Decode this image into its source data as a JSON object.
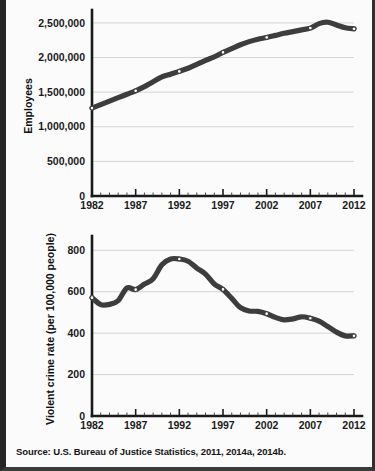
{
  "figure": {
    "background_color": "#fbfbfb",
    "frame_color": "#2b2b2b",
    "source_note": "Source: U.S. Bureau of Justice Statistics, 2011, 2014a, 2014b."
  },
  "chart_data": [
    {
      "type": "line",
      "id": "employees",
      "title": "",
      "xlabel": "",
      "ylabel": "Employees",
      "xlim": [
        1982,
        2012
      ],
      "ylim": [
        0,
        2600000
      ],
      "grid": true,
      "legend": "none",
      "xticks": [
        1982,
        1987,
        1992,
        1997,
        2002,
        2007,
        2012
      ],
      "xtick_labels": [
        "1982",
        "1987",
        "1992",
        "1997",
        "2002",
        "2007",
        "2012"
      ],
      "minor_xtick_interval": 1,
      "yticks": [
        0,
        500000,
        1000000,
        1500000,
        2000000,
        2500000
      ],
      "ytick_labels": [
        "0",
        "500,000",
        "1,000,000",
        "1,500,000",
        "2,000,000",
        "2,500,000"
      ],
      "line_color": "#3d3d3d",
      "marker_color": "#ffffff",
      "x": [
        1982,
        1983,
        1984,
        1985,
        1986,
        1987,
        1988,
        1989,
        1990,
        1991,
        1992,
        1993,
        1994,
        1995,
        1996,
        1997,
        1998,
        1999,
        2000,
        2001,
        2002,
        2003,
        2004,
        2005,
        2006,
        2007,
        2008,
        2009,
        2010,
        2011,
        2012
      ],
      "values": [
        1270000,
        1320000,
        1370000,
        1420000,
        1470000,
        1520000,
        1580000,
        1650000,
        1720000,
        1760000,
        1800000,
        1845000,
        1900000,
        1960000,
        2010000,
        2075000,
        2130000,
        2185000,
        2230000,
        2265000,
        2290000,
        2320000,
        2350000,
        2375000,
        2400000,
        2425000,
        2490000,
        2510000,
        2470000,
        2430000,
        2415000
      ],
      "markers_at": [
        1982,
        1987,
        1992,
        1997,
        2002,
        2007,
        2012
      ]
    },
    {
      "type": "line",
      "id": "violent-crime-rate",
      "title": "",
      "xlabel": "",
      "ylabel": "Violent crime rate (per 100,000 people)",
      "xlim": [
        1982,
        2012
      ],
      "ylim": [
        0,
        840
      ],
      "grid": true,
      "legend": "none",
      "xticks": [
        1982,
        1987,
        1992,
        1997,
        2002,
        2007,
        2012
      ],
      "xtick_labels": [
        "1982",
        "1987",
        "1992",
        "1997",
        "2002",
        "2007",
        "2012"
      ],
      "minor_xtick_interval": 1,
      "yticks": [
        0,
        200,
        400,
        600,
        800
      ],
      "ytick_labels": [
        "0",
        "200",
        "400",
        "600",
        "800"
      ],
      "line_color": "#3d3d3d",
      "marker_color": "#ffffff",
      "x": [
        1982,
        1983,
        1984,
        1985,
        1986,
        1987,
        1988,
        1989,
        1990,
        1991,
        1992,
        1993,
        1994,
        1995,
        1996,
        1997,
        1998,
        1999,
        2000,
        2001,
        2002,
        2003,
        2004,
        2005,
        2006,
        2007,
        2008,
        2009,
        2010,
        2011,
        2012
      ],
      "values": [
        571,
        538,
        539,
        557,
        618,
        610,
        637,
        663,
        730,
        758,
        758,
        747,
        714,
        685,
        637,
        611,
        568,
        523,
        507,
        505,
        494,
        476,
        464,
        469,
        479,
        472,
        458,
        432,
        405,
        387,
        387
      ],
      "markers_at": [
        1982,
        1987,
        1992,
        1997,
        2002,
        2007,
        2012
      ]
    }
  ]
}
